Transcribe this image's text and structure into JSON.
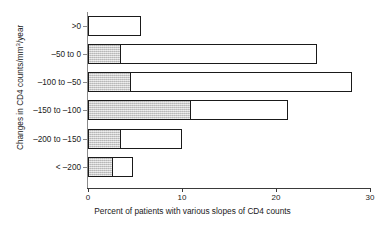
{
  "chart_data": {
    "type": "bar",
    "orientation": "horizontal",
    "title": "",
    "xlabel": "Percent of patients with various slopes of CD4 counts",
    "ylabel": "Changes in CD4 counts/mm³/year",
    "ylabel_parts": {
      "pre": "Changes in CD4 counts/mm",
      "sup": "3",
      "post": "/year"
    },
    "categories": [
      ">0",
      "–50 to 0",
      "–100 to –50",
      "–150 to –100",
      "–200 to –150",
      "< –200"
    ],
    "values": [
      5.6,
      24.4,
      28.1,
      21.3,
      10.0,
      4.8
    ],
    "series": [
      {
        "name": "shaded",
        "values": [
          0.0,
          3.5,
          4.6,
          11.0,
          3.5,
          2.7
        ]
      },
      {
        "name": "unshaded",
        "values": [
          5.6,
          24.4,
          28.1,
          21.3,
          10.0,
          4.8
        ]
      }
    ],
    "xlim": [
      0,
      30
    ],
    "xticks": [
      0,
      10,
      20,
      30
    ],
    "xticklabels": [
      "0",
      "10",
      "20",
      "30"
    ],
    "grid": false,
    "legend": "none",
    "colors": {
      "fill_shaded": "#c9c9c9",
      "fill_unshaded": "#ffffff",
      "outline": "#1a1a1a",
      "axis": "#3a3a3a"
    }
  }
}
